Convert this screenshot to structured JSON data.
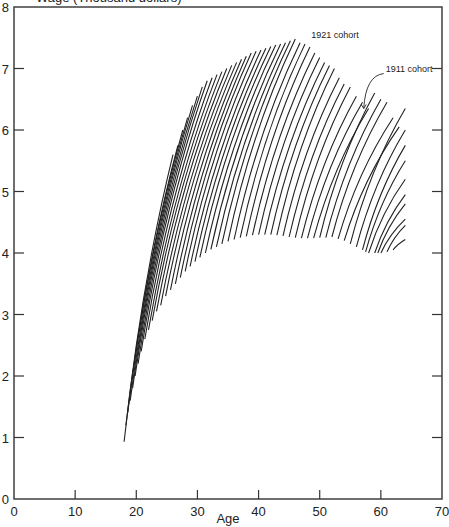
{
  "chart_data": {
    "type": "line",
    "title": "",
    "ylabel": "Wage (Thousand dollars)",
    "xlabel": "Age",
    "xlim": [
      0,
      70
    ],
    "ylim": [
      0,
      8
    ],
    "grid": false,
    "legend": "none",
    "x_ticks": [
      0,
      10,
      20,
      30,
      40,
      50,
      60,
      70
    ],
    "y_ticks": [
      0,
      1,
      2,
      3,
      4,
      5,
      6,
      7,
      8
    ],
    "annotations": [
      {
        "text": "1921 cohort",
        "x": 48.6,
        "y": 7.5
      },
      {
        "text": "1911 cohort",
        "x": 60.8,
        "y": 6.95,
        "arrow_to": [
          57.2,
          6.35
        ]
      }
    ],
    "envelope": [
      [
        18,
        0.93
      ],
      [
        19,
        1.6
      ],
      [
        20,
        2.1
      ],
      [
        21,
        2.45
      ],
      [
        22,
        2.75
      ],
      [
        23,
        2.95
      ],
      [
        24,
        3.15
      ],
      [
        25,
        3.3
      ],
      [
        26,
        3.45
      ],
      [
        27,
        3.6
      ],
      [
        28,
        3.72
      ],
      [
        29,
        3.83
      ],
      [
        30,
        3.92
      ],
      [
        32,
        4.05
      ],
      [
        34,
        4.15
      ],
      [
        36,
        4.22
      ],
      [
        38,
        4.27
      ],
      [
        40,
        4.3
      ],
      [
        42,
        4.3
      ],
      [
        44,
        4.28
      ],
      [
        46,
        4.25
      ],
      [
        48,
        4.24
      ],
      [
        50,
        4.25
      ],
      [
        52,
        4.26
      ],
      [
        54,
        4.2
      ],
      [
        56,
        4.1
      ],
      [
        58,
        4.02
      ],
      [
        60,
        4.0
      ]
    ],
    "series": [
      {
        "name": "cohort-1",
        "start": [
          18,
          0.93
        ],
        "end": [
          26.0,
          5.6
        ]
      },
      {
        "name": "cohort-2",
        "start": [
          18.3,
          1.2
        ],
        "end": [
          26.8,
          5.75
        ]
      },
      {
        "name": "cohort-3",
        "start": [
          18.6,
          1.4
        ],
        "end": [
          27.6,
          6.0
        ]
      },
      {
        "name": "cohort-4",
        "start": [
          19.0,
          1.6
        ],
        "end": [
          28.4,
          6.2
        ]
      },
      {
        "name": "cohort-5",
        "start": [
          19.4,
          1.8
        ],
        "end": [
          29.2,
          6.4
        ]
      },
      {
        "name": "cohort-6",
        "start": [
          19.8,
          2.0
        ],
        "end": [
          30.0,
          6.55
        ]
      },
      {
        "name": "cohort-7",
        "start": [
          20.3,
          2.2
        ],
        "end": [
          30.8,
          6.7
        ]
      },
      {
        "name": "cohort-8",
        "start": [
          20.8,
          2.4
        ],
        "end": [
          31.6,
          6.8
        ]
      },
      {
        "name": "cohort-9",
        "start": [
          21.4,
          2.6
        ],
        "end": [
          32.4,
          6.85
        ]
      },
      {
        "name": "cohort-10",
        "start": [
          22.0,
          2.75
        ],
        "end": [
          33.2,
          6.9
        ]
      },
      {
        "name": "cohort-11",
        "start": [
          22.6,
          2.9
        ],
        "end": [
          34.0,
          6.95
        ]
      },
      {
        "name": "cohort-12",
        "start": [
          23.3,
          3.05
        ],
        "end": [
          34.8,
          7.0
        ]
      },
      {
        "name": "cohort-13",
        "start": [
          24.0,
          3.15
        ],
        "end": [
          35.6,
          7.05
        ]
      },
      {
        "name": "cohort-14",
        "start": [
          24.8,
          3.3
        ],
        "end": [
          36.4,
          7.1
        ]
      },
      {
        "name": "cohort-15",
        "start": [
          25.6,
          3.4
        ],
        "end": [
          37.2,
          7.15
        ]
      },
      {
        "name": "cohort-16",
        "start": [
          26.4,
          3.5
        ],
        "end": [
          38.0,
          7.2
        ]
      },
      {
        "name": "cohort-17",
        "start": [
          27.2,
          3.6
        ],
        "end": [
          38.8,
          7.25
        ]
      },
      {
        "name": "cohort-18",
        "start": [
          28.0,
          3.7
        ],
        "end": [
          39.6,
          7.28
        ]
      },
      {
        "name": "cohort-19",
        "start": [
          28.8,
          3.78
        ],
        "end": [
          40.4,
          7.3
        ]
      },
      {
        "name": "cohort-20",
        "start": [
          29.6,
          3.86
        ],
        "end": [
          41.2,
          7.33
        ]
      },
      {
        "name": "cohort-21",
        "start": [
          30.4,
          3.93
        ],
        "end": [
          42.0,
          7.36
        ]
      },
      {
        "name": "cohort-22",
        "start": [
          31.3,
          4.0
        ],
        "end": [
          42.8,
          7.38
        ]
      },
      {
        "name": "cohort-23",
        "start": [
          32.2,
          4.06
        ],
        "end": [
          43.6,
          7.4
        ]
      },
      {
        "name": "cohort-24",
        "start": [
          33.1,
          4.1
        ],
        "end": [
          44.4,
          7.42
        ]
      },
      {
        "name": "cohort-25",
        "start": [
          34.0,
          4.15
        ],
        "end": [
          45.2,
          7.45
        ]
      },
      {
        "name": "cohort-26",
        "start": [
          35.0,
          4.19
        ],
        "end": [
          46.0,
          7.48
        ]
      },
      {
        "name": "cohort-27",
        "start": [
          36.0,
          4.22
        ],
        "end": [
          46.8,
          7.42
        ]
      },
      {
        "name": "cohort-28",
        "start": [
          37.0,
          4.25
        ],
        "end": [
          47.6,
          7.4
        ]
      },
      {
        "name": "cohort-29",
        "start": [
          38.0,
          4.27
        ],
        "end": [
          48.4,
          7.35
        ]
      },
      {
        "name": "cohort-30",
        "start": [
          39.0,
          4.29
        ],
        "end": [
          49.2,
          7.25
        ]
      },
      {
        "name": "cohort-31",
        "start": [
          40.0,
          4.3
        ],
        "end": [
          50.0,
          7.18
        ]
      },
      {
        "name": "cohort-32",
        "start": [
          41.0,
          4.3
        ],
        "end": [
          50.8,
          7.1
        ]
      },
      {
        "name": "cohort-33",
        "start": [
          42.0,
          4.3
        ],
        "end": [
          51.6,
          7.05
        ]
      },
      {
        "name": "cohort-34",
        "start": [
          43.0,
          4.29
        ],
        "end": [
          52.4,
          7.0
        ]
      },
      {
        "name": "cohort-35",
        "start": [
          44.0,
          4.28
        ],
        "end": [
          53.2,
          6.85
        ]
      },
      {
        "name": "cohort-36",
        "start": [
          45.0,
          4.26
        ],
        "end": [
          54.0,
          6.75
        ]
      },
      {
        "name": "cohort-37",
        "start": [
          46.0,
          4.25
        ],
        "end": [
          55.0,
          6.7
        ]
      },
      {
        "name": "cohort-38",
        "start": [
          47.0,
          4.24
        ],
        "end": [
          56.0,
          6.55
        ]
      },
      {
        "name": "cohort-39",
        "start": [
          48.0,
          4.24
        ],
        "end": [
          57.0,
          6.45
        ]
      },
      {
        "name": "cohort-40",
        "start": [
          49.0,
          4.24
        ],
        "end": [
          58.0,
          6.35
        ]
      },
      {
        "name": "cohort-41",
        "start": [
          50.0,
          4.25
        ],
        "end": [
          59.0,
          6.6
        ]
      },
      {
        "name": "cohort-42",
        "start": [
          51.0,
          4.25
        ],
        "end": [
          60.0,
          6.5
        ]
      },
      {
        "name": "cohort-43",
        "start": [
          52.0,
          4.26
        ],
        "end": [
          61.0,
          6.45
        ]
      },
      {
        "name": "cohort-44",
        "start": [
          53.0,
          4.23
        ],
        "end": [
          62.0,
          6.2
        ]
      },
      {
        "name": "cohort-45",
        "start": [
          54.0,
          4.2
        ],
        "end": [
          63.0,
          6.05
        ]
      },
      {
        "name": "cohort-46",
        "start": [
          55.0,
          4.15
        ],
        "end": [
          64.0,
          6.35
        ]
      },
      {
        "name": "cohort-47",
        "start": [
          56.0,
          4.1
        ],
        "end": [
          64.0,
          6.0
        ]
      },
      {
        "name": "cohort-48",
        "start": [
          57.0,
          4.05
        ],
        "end": [
          64.0,
          5.75
        ]
      },
      {
        "name": "cohort-49",
        "start": [
          57.5,
          4.02
        ],
        "end": [
          64.0,
          5.5
        ]
      },
      {
        "name": "cohort-50",
        "start": [
          58.0,
          4.0
        ],
        "end": [
          64.0,
          5.2
        ]
      },
      {
        "name": "cohort-51",
        "start": [
          59.0,
          4.0
        ],
        "end": [
          64.0,
          4.95
        ]
      },
      {
        "name": "cohort-52",
        "start": [
          59.5,
          4.0
        ],
        "end": [
          64.0,
          4.8
        ]
      },
      {
        "name": "cohort-53",
        "start": [
          60.0,
          4.0
        ],
        "end": [
          64.0,
          4.55
        ]
      },
      {
        "name": "cohort-54",
        "start": [
          61.0,
          4.02
        ],
        "end": [
          64.0,
          4.45
        ]
      },
      {
        "name": "cohort-55",
        "start": [
          62.0,
          4.05
        ],
        "end": [
          64.0,
          4.22
        ]
      }
    ]
  }
}
